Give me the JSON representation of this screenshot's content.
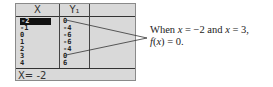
{
  "table": {
    "headers": {
      "x": "X",
      "y": "Y₁"
    },
    "rows": [
      {
        "x": "-2",
        "y": "0",
        "selected": true
      },
      {
        "x": "-1",
        "y": "-4"
      },
      {
        "x": "0",
        "y": "-6"
      },
      {
        "x": "1",
        "y": "-6"
      },
      {
        "x": "2",
        "y": "-4"
      },
      {
        "x": "3",
        "y": "0"
      },
      {
        "x": "4",
        "y": "6"
      }
    ],
    "status": "X= -2"
  },
  "annotation": {
    "line1_prefix": "When ",
    "line1_var1": "x",
    "line1_mid": " = −2 and ",
    "line1_var2": "x",
    "line1_suffix": " = 3,",
    "line2_func": "f",
    "line2_open": "(",
    "line2_var": "x",
    "line2_rest": ") = 0."
  }
}
